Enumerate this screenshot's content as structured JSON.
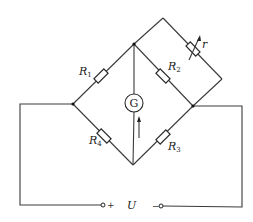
{
  "diagram": {
    "components": {
      "R1": {
        "label": "R",
        "sub": "1"
      },
      "R2": {
        "label": "R",
        "sub": "2"
      },
      "R3": {
        "label": "R",
        "sub": "3"
      },
      "R4": {
        "label": "R",
        "sub": "4"
      },
      "r": {
        "label": "r",
        "type": "variable-resistor"
      },
      "G": {
        "label": "G",
        "type": "galvanometer"
      }
    },
    "source": {
      "label": "U",
      "plus": "+",
      "minus": "−"
    },
    "colors": {
      "wire": "#3a3a3a",
      "background": "#ffffff"
    }
  }
}
